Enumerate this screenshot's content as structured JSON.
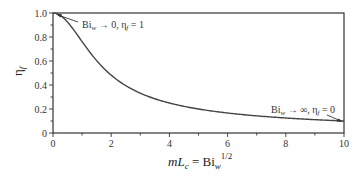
{
  "chart_data": {
    "type": "line",
    "title": "",
    "xlabel": "mL_c = Bi_w^1/2",
    "ylabel": "η_f",
    "xlim": [
      0,
      10
    ],
    "ylim": [
      0,
      1.0
    ],
    "grid": false,
    "x_ticks": [
      "0",
      "2",
      "4",
      "6",
      "8",
      "10"
    ],
    "y_ticks": [
      "0",
      "0.2",
      "0.4",
      "0.6",
      "0.8",
      "1.0"
    ],
    "series": [
      {
        "name": "η_f = tanh(mL_c)/(mL_c)",
        "x": [
          0,
          0.25,
          0.5,
          0.75,
          1,
          1.25,
          1.5,
          2,
          2.5,
          3,
          3.5,
          4,
          5,
          6,
          7,
          8,
          9,
          10
        ],
        "values": [
          1.0,
          0.98,
          0.924,
          0.847,
          0.762,
          0.679,
          0.603,
          0.482,
          0.395,
          0.332,
          0.285,
          0.25,
          0.2,
          0.167,
          0.143,
          0.125,
          0.111,
          0.1
        ]
      }
    ],
    "annotations": [
      {
        "text": "Bi_w → 0, η_f = 1",
        "points_to": [
          0,
          1.0
        ]
      },
      {
        "text": "Bi_w → ∞, η_f = 0",
        "points_to": [
          10,
          0.1
        ]
      }
    ]
  },
  "labels": {
    "y_axis": {
      "main": "η",
      "sub": "f"
    },
    "x_axis": {
      "m": "mL",
      "sub_c": "c",
      "eq": " = Bi",
      "sub_w": "w",
      "sup": "1/2"
    },
    "annot_left": {
      "bi": "Bi",
      "sub_w": "w",
      "rest": " → 0, η",
      "sub_f": "f",
      "val": " = 1"
    },
    "annot_right": {
      "bi": "Bi",
      "sub_w": "w",
      "rest": " → ∞, η",
      "sub_f": "f",
      "val": " = 0"
    }
  }
}
